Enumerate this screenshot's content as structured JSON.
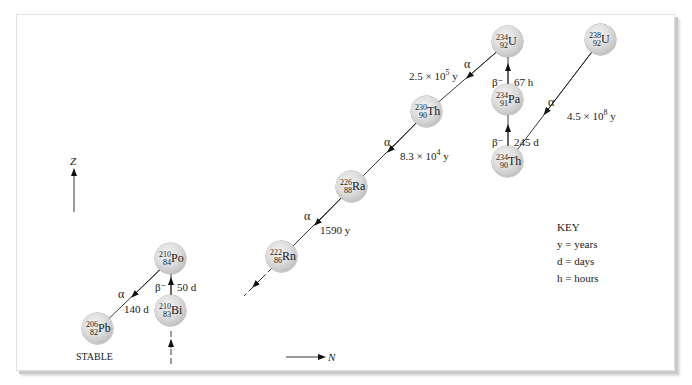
{
  "diagram": {
    "axes": {
      "vertical_label": "Z",
      "horizontal_label": "N"
    },
    "nuclides": [
      {
        "id": "u238",
        "mass": "238",
        "z": "92",
        "symbol": "U"
      },
      {
        "id": "th234",
        "mass": "234",
        "z": "90",
        "symbol": "Th"
      },
      {
        "id": "pa234",
        "mass": "234",
        "z": "91",
        "symbol": "Pa"
      },
      {
        "id": "u234",
        "mass": "234",
        "z": "92",
        "symbol": "U"
      },
      {
        "id": "th230",
        "mass": "230",
        "z": "90",
        "symbol": "Th"
      },
      {
        "id": "ra226",
        "mass": "226",
        "z": "88",
        "symbol": "Ra"
      },
      {
        "id": "rn222",
        "mass": "222",
        "z": "86",
        "symbol": "Rn"
      },
      {
        "id": "po210",
        "mass": "210",
        "z": "84",
        "symbol": "Po"
      },
      {
        "id": "bi210",
        "mass": "210",
        "z": "83",
        "symbol": "Bi"
      },
      {
        "id": "pb206",
        "mass": "206",
        "z": "82",
        "symbol": "Pb"
      }
    ],
    "decays": [
      {
        "from": "u238",
        "to": "th234",
        "type": "α",
        "half_life_base": "4.5 × 10",
        "half_life_exp": "8",
        "half_life_unit": " y"
      },
      {
        "from": "th234",
        "to": "pa234",
        "type": "β⁻",
        "half_life": "245 d"
      },
      {
        "from": "pa234",
        "to": "u234",
        "type": "β⁻",
        "half_life": "67 h"
      },
      {
        "from": "u234",
        "to": "th230",
        "type": "α",
        "half_life_base": "2.5 × 10",
        "half_life_exp": "5",
        "half_life_unit": " y"
      },
      {
        "from": "th230",
        "to": "ra226",
        "type": "α",
        "half_life_base": "8.3 × 10",
        "half_life_exp": "4",
        "half_life_unit": " y"
      },
      {
        "from": "ra226",
        "to": "rn222",
        "type": "α",
        "half_life": "1590 y"
      },
      {
        "from": "bi210",
        "to": "po210",
        "type": "β⁻",
        "half_life": "50 d"
      },
      {
        "from": "po210",
        "to": "pb206",
        "type": "α",
        "half_life": "140 d"
      }
    ],
    "stable_label": "STABLE",
    "key": {
      "title": "KEY",
      "items": [
        "y = years",
        "d = days",
        "h = hours"
      ]
    }
  }
}
